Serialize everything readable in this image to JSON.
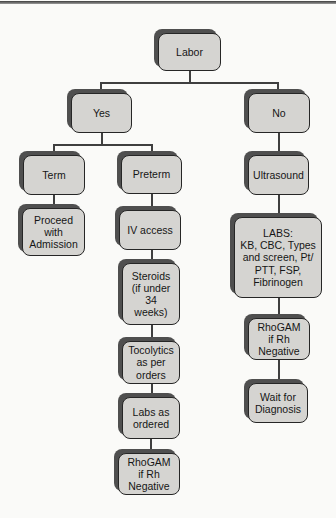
{
  "page": {
    "background": "#fafaf8",
    "top_rule_color": "#3c3c3c"
  },
  "flowchart": {
    "box_fill": "#d5d4d1",
    "box_border": "#262626",
    "box_shadow": "#4f4f4f",
    "line_color": "#3f3f3f",
    "nodes": [
      {
        "id": "labor",
        "label": "Labor"
      },
      {
        "id": "yes",
        "label": "Yes"
      },
      {
        "id": "no",
        "label": "No"
      },
      {
        "id": "term",
        "label": "Term"
      },
      {
        "id": "preterm",
        "label": "Preterm"
      },
      {
        "id": "ultrasound",
        "label": "Ultrasound"
      },
      {
        "id": "proceed",
        "label": "Proceed\nwith\nAdmission"
      },
      {
        "id": "iv-access",
        "label": "IV access"
      },
      {
        "id": "labs-panel",
        "label": "LABS:\nKB, CBC, Types\nand screen, Pt/\nPTT, FSP,\nFibrinogen"
      },
      {
        "id": "steroids",
        "label": "Steroids\n(if under\n34\nweeks)"
      },
      {
        "id": "rhogam-right",
        "label": "RhoGAM\nif Rh\nNegative"
      },
      {
        "id": "tocolytics",
        "label": "Tocolytics\nas per\norders"
      },
      {
        "id": "wait-diagnosis",
        "label": "Wait for\nDiagnosis"
      },
      {
        "id": "labs-ordered",
        "label": "Labs as\nordered"
      },
      {
        "id": "rhogam-bottom",
        "label": "RhoGAM\nif Rh\nNegative"
      }
    ]
  }
}
